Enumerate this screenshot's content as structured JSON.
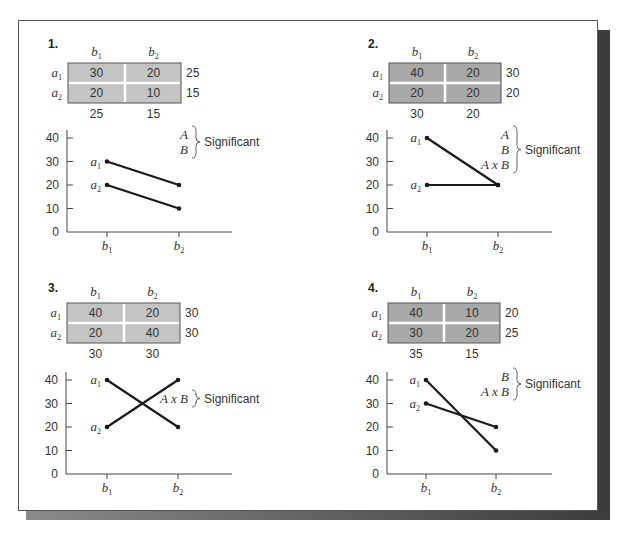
{
  "figure": {
    "colors": {
      "table_light": "#c4c4c4",
      "table_dark": "#a9a9a9",
      "line": "#1a1a1a",
      "text": "#333333",
      "frame_shadow": "#3c3c3c"
    },
    "significant_label": "Significant",
    "row_labels": [
      "a1",
      "a2"
    ],
    "col_labels": [
      "b1",
      "b2"
    ],
    "y_ticks": [
      "0",
      "10",
      "20",
      "30",
      "40"
    ]
  },
  "chart_data": [
    {
      "type": "line",
      "panel": "1.",
      "title": "1.",
      "table": {
        "rows": [
          "a1",
          "a2"
        ],
        "cols": [
          "b1",
          "b2"
        ],
        "cells": [
          [
            30,
            20
          ],
          [
            20,
            10
          ]
        ],
        "row_means": [
          25,
          15
        ],
        "col_means": [
          25,
          15
        ]
      },
      "categories": [
        "b1",
        "b2"
      ],
      "series": [
        {
          "name": "a1",
          "values": [
            30,
            20
          ]
        },
        {
          "name": "a2",
          "values": [
            20,
            10
          ]
        }
      ],
      "ylim": [
        0,
        40
      ],
      "yticks": [
        0,
        10,
        20,
        30,
        40
      ],
      "significant_effects": [
        "A",
        "B"
      ],
      "annotation": "A, B } Significant"
    },
    {
      "type": "line",
      "panel": "2.",
      "title": "2.",
      "table": {
        "rows": [
          "a1",
          "a2"
        ],
        "cols": [
          "b1",
          "b2"
        ],
        "cells": [
          [
            40,
            20
          ],
          [
            20,
            20
          ]
        ],
        "row_means": [
          30,
          20
        ],
        "col_means": [
          30,
          20
        ]
      },
      "categories": [
        "b1",
        "b2"
      ],
      "series": [
        {
          "name": "a1",
          "values": [
            40,
            20
          ]
        },
        {
          "name": "a2",
          "values": [
            20,
            20
          ]
        }
      ],
      "ylim": [
        0,
        40
      ],
      "yticks": [
        0,
        10,
        20,
        30,
        40
      ],
      "significant_effects": [
        "A",
        "B",
        "A x B"
      ],
      "annotation": "A, B, A x B } Significant"
    },
    {
      "type": "line",
      "panel": "3.",
      "title": "3.",
      "table": {
        "rows": [
          "a1",
          "a2"
        ],
        "cols": [
          "b1",
          "b2"
        ],
        "cells": [
          [
            40,
            20
          ],
          [
            20,
            40
          ]
        ],
        "row_means": [
          30,
          30
        ],
        "col_means": [
          30,
          30
        ]
      },
      "categories": [
        "b1",
        "b2"
      ],
      "series": [
        {
          "name": "a1",
          "values": [
            40,
            20
          ]
        },
        {
          "name": "a2",
          "values": [
            20,
            40
          ]
        }
      ],
      "ylim": [
        0,
        40
      ],
      "yticks": [
        0,
        10,
        20,
        30,
        40
      ],
      "significant_effects": [
        "A x B"
      ],
      "annotation": "A x B } Significant"
    },
    {
      "type": "line",
      "panel": "4.",
      "title": "4.",
      "table": {
        "rows": [
          "a1",
          "a2"
        ],
        "cols": [
          "b1",
          "b2"
        ],
        "cells": [
          [
            40,
            10
          ],
          [
            30,
            20
          ]
        ],
        "row_means": [
          20,
          25
        ],
        "col_means": [
          35,
          15
        ]
      },
      "categories": [
        "b1",
        "b2"
      ],
      "series": [
        {
          "name": "a1",
          "values": [
            40,
            10
          ]
        },
        {
          "name": "a2",
          "values": [
            30,
            20
          ]
        }
      ],
      "ylim": [
        0,
        40
      ],
      "yticks": [
        0,
        10,
        20,
        30,
        40
      ],
      "significant_effects": [
        "B",
        "A x B"
      ],
      "annotation": "B, A x B } Significant"
    }
  ]
}
